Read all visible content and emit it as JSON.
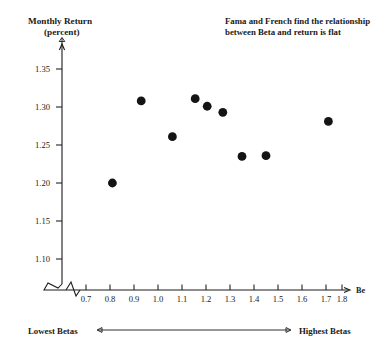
{
  "chart_data": {
    "type": "scatter",
    "title": "",
    "annotation": "Fama and French find the relationship between Beta and return is flat",
    "annotation_line1": "Fama and French find the relationship",
    "annotation_line2": "between Beta and return is flat",
    "xlabel": "Be",
    "ylabel_line1": "Monthly Return",
    "ylabel_line2": "(percent)",
    "xlim": [
      0.65,
      1.85
    ],
    "ylim": [
      1.075,
      1.375
    ],
    "xticks": [
      0.7,
      0.8,
      0.9,
      1.0,
      1.1,
      1.2,
      1.3,
      1.4,
      1.5,
      1.6,
      1.7,
      1.8
    ],
    "xtick_labels": [
      "0.7",
      "0.8",
      "0.9",
      "1.0",
      "1.1",
      "1.2",
      "1.3",
      "1.4",
      "1.5",
      "1.6",
      "1.7",
      "1.8"
    ],
    "yticks": [
      1.1,
      1.15,
      1.2,
      1.25,
      1.3,
      1.35
    ],
    "ytick_labels": [
      "1.10",
      "1.15",
      "1.20",
      "1.25",
      "1.30",
      "1.35"
    ],
    "grid": false,
    "legend": "none",
    "axis_break_x": true,
    "axis_break_y": true,
    "x": [
      0.81,
      0.93,
      1.06,
      1.155,
      1.205,
      1.27,
      1.35,
      1.45,
      1.71
    ],
    "y": [
      1.2,
      1.308,
      1.261,
      1.311,
      1.301,
      1.293,
      1.235,
      1.236,
      1.281
    ],
    "points": [
      {
        "beta": 0.81,
        "return": 1.2
      },
      {
        "beta": 0.93,
        "return": 1.308
      },
      {
        "beta": 1.06,
        "return": 1.261
      },
      {
        "beta": 1.155,
        "return": 1.311
      },
      {
        "beta": 1.205,
        "return": 1.301
      },
      {
        "beta": 1.27,
        "return": 1.293
      },
      {
        "beta": 1.35,
        "return": 1.235
      },
      {
        "beta": 1.45,
        "return": 1.236
      },
      {
        "beta": 1.71,
        "return": 1.281
      }
    ],
    "marker_color": "#141414",
    "axis_color": "#1a1a1a"
  },
  "range_axis": {
    "low_label": "Lowest Betas",
    "high_label": "Highest Betas"
  }
}
